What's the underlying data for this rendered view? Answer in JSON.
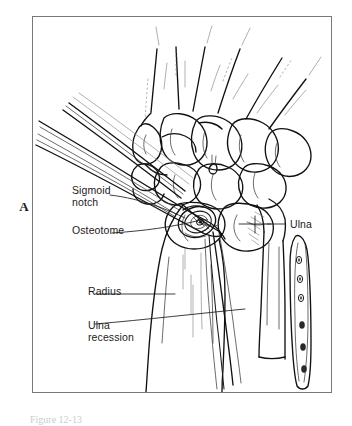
{
  "figure": {
    "panel_letter": "A",
    "caption_partial": "Figure 12-13",
    "frame_color": "#77787b",
    "ink_color": "#1b1b1b",
    "background_color": "#ffffff"
  },
  "labels": {
    "sigmoid_notch_line1": "Sigmoid",
    "sigmoid_notch_line2": "notch",
    "osteotome": "Osteotome",
    "radius": "Radius",
    "ulna_recession_line1": "Ulna",
    "ulna_recession_line2": "recession",
    "ulna": "Ulna"
  },
  "anatomy": {
    "structures": [
      "metacarpals",
      "carpal bones",
      "distal radius",
      "distal ulna",
      "sigmoid notch",
      "ulnar head"
    ],
    "instrument": "osteotome"
  }
}
